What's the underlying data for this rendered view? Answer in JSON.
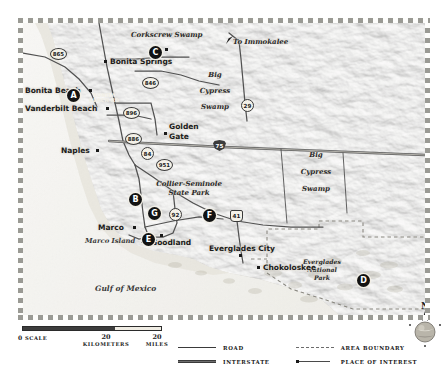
{
  "map": {
    "title": "Southwest Florida / Everglades regional map",
    "water_labels": [
      {
        "id": "gulf-of-mexico",
        "text": "Gulf of Mexico"
      },
      {
        "id": "marco-island",
        "text": "Marco Island"
      }
    ],
    "feature_labels": [
      {
        "id": "corkscrew-swamp",
        "text": "Corkscrew Swamp"
      },
      {
        "id": "to-immokalee",
        "text": "To Immokalee"
      },
      {
        "id": "big-cypress-swamp-west",
        "lines": [
          "Big",
          "Cypress",
          "Swamp"
        ]
      },
      {
        "id": "big-cypress-swamp-east",
        "lines": [
          "Big",
          "Cypress",
          "Swamp"
        ]
      },
      {
        "id": "collier-seminole-state-park",
        "lines": [
          "Collier-Seminole",
          "State Park"
        ]
      },
      {
        "id": "everglades-national-park",
        "lines": [
          "Everglades",
          "National",
          "Park"
        ]
      }
    ],
    "places": [
      {
        "id": "bonita-springs",
        "text": "Bonita Springs"
      },
      {
        "id": "bonita-beach",
        "text": "Bonita Beach"
      },
      {
        "id": "vanderbilt-beach",
        "text": "Vanderbilt Beach"
      },
      {
        "id": "golden-gate",
        "lines": [
          "Golden",
          "Gate"
        ]
      },
      {
        "id": "naples",
        "text": "Naples"
      },
      {
        "id": "marco",
        "text": "Marco"
      },
      {
        "id": "goodland",
        "text": "Goodland"
      },
      {
        "id": "everglades-city",
        "text": "Everglades City"
      },
      {
        "id": "chokoloskee",
        "text": "Chokoloskee"
      }
    ],
    "road_labels": [
      {
        "id": "bonita-beach-rd",
        "lines": [
          "BONITA",
          "BEACH RD"
        ]
      }
    ],
    "shields": [
      {
        "id": "shield-865",
        "number": "865",
        "kind": "state"
      },
      {
        "id": "shield-846",
        "number": "846",
        "kind": "state"
      },
      {
        "id": "shield-29",
        "number": "29",
        "kind": "st-rnd"
      },
      {
        "id": "shield-896",
        "number": "896",
        "kind": "state"
      },
      {
        "id": "shield-886",
        "number": "886",
        "kind": "state"
      },
      {
        "id": "shield-84",
        "number": "84",
        "kind": "st-rnd"
      },
      {
        "id": "shield-951",
        "number": "951",
        "kind": "state"
      },
      {
        "id": "shield-92",
        "number": "92",
        "kind": "st-rnd"
      },
      {
        "id": "shield-41",
        "number": "41",
        "kind": "us"
      },
      {
        "id": "shield-75",
        "number": "75",
        "kind": "inter"
      }
    ],
    "markers": [
      {
        "id": "marker-a",
        "label": "A"
      },
      {
        "id": "marker-b",
        "label": "B"
      },
      {
        "id": "marker-c",
        "label": "C"
      },
      {
        "id": "marker-d",
        "label": "D"
      },
      {
        "id": "marker-e",
        "label": "E"
      },
      {
        "id": "marker-f",
        "label": "F"
      },
      {
        "id": "marker-g",
        "label": "G"
      }
    ],
    "compass": {
      "north": "N"
    }
  },
  "scale": {
    "zero": "0",
    "zero_word": "SCALE",
    "km_value": "20",
    "km_unit": "KILOMETERS",
    "mi_value": "20",
    "mi_unit": "MILES"
  },
  "legend": {
    "items": [
      {
        "id": "legend-road",
        "label": "ROAD",
        "key": "road-line"
      },
      {
        "id": "legend-interstate",
        "label": "INTERSTATE",
        "key": "interstate-line"
      },
      {
        "id": "legend-area-boundary",
        "label": "AREA BOUNDARY",
        "key": "dashed-line"
      },
      {
        "id": "legend-place-of-interest",
        "label": "PLACE OF INTEREST",
        "key": "square-marker"
      }
    ]
  },
  "colors": {
    "land": "#d8d4c9",
    "water": "#efeee9",
    "road": "#4a4a4a",
    "interstate": "#5a5a5a",
    "boundary": "#7a7a74",
    "marker": "#121212"
  }
}
